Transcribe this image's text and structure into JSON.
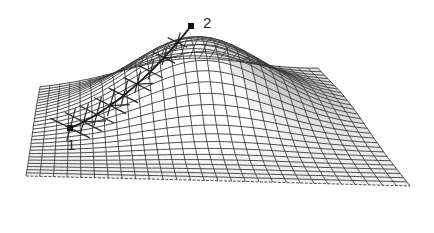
{
  "figure": {
    "mesh": {
      "rows": 28,
      "cols": 28,
      "line_color": "#3a3a3a",
      "fill_light": "#ffffff",
      "fill_dark": "#9a9a9a",
      "corners": {
        "back_left": [
          40,
          88
        ],
        "front_left": [
          26,
          176
        ],
        "front_right": [
          410,
          186
        ],
        "back_right": [
          318,
          70
        ]
      },
      "peak": {
        "center_u": 0.52,
        "center_v": 0.32,
        "height_px": 72,
        "sigma": 0.22
      }
    },
    "path": {
      "color": "#1a1a1a",
      "frame_color": "#2a2a2a",
      "steps": 9
    },
    "points": [
      {
        "id": "point-1",
        "label": "1",
        "marker": [
          70,
          128
        ],
        "label_pos": [
          67,
          137
        ]
      },
      {
        "id": "point-2",
        "label": "2",
        "marker": [
          191,
          26
        ],
        "label_pos": [
          203,
          15
        ]
      }
    ]
  }
}
